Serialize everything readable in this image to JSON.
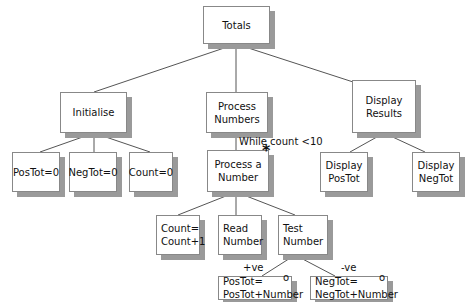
{
  "diagram": {
    "type": "jackson-structure-chart",
    "nodes": {
      "totals": {
        "label": "Totals"
      },
      "initialise": {
        "label": "Initialise"
      },
      "process_numbers": {
        "label": "Process\nNumbers"
      },
      "display_results": {
        "label": "Display\nResults"
      },
      "postot_zero": {
        "label": "PosTot=0"
      },
      "negtot_zero": {
        "label": "NegTot=0"
      },
      "count_zero": {
        "label": "Count=0"
      },
      "process_a_number": {
        "label": "Process a\nNumber",
        "marker": "*"
      },
      "display_postot": {
        "label": "Display\nPosTot"
      },
      "display_negtot": {
        "label": "Display\nNegTot"
      },
      "count_inc": {
        "label": "Count=\nCount+1"
      },
      "read_number": {
        "label": "Read\nNumber"
      },
      "test_number": {
        "label": "Test\nNumber"
      },
      "postot_add": {
        "label": "PosTot=\nPosTot+Number",
        "marker": "o"
      },
      "negtot_add": {
        "label": "NegTot=\nNegTot+Number",
        "marker": "o"
      }
    },
    "annotations": {
      "loop_condition": "While count <10",
      "pos_branch": "+ve",
      "neg_branch": "-ve"
    }
  }
}
